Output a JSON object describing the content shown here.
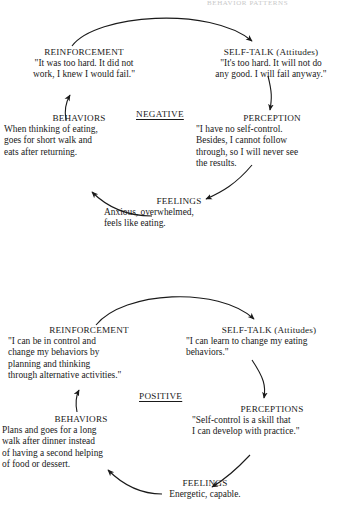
{
  "page": {
    "cropped_header": "BEHAVIOR PATTERNS"
  },
  "diagrams": [
    {
      "id": "negative-cycle",
      "center_label": "NEGATIVE",
      "nodes": [
        {
          "key": "reinforcement",
          "title": "REINFORCEMENT",
          "body": "\"It was too hard. It did not\nwork, I knew I would fail.\""
        },
        {
          "key": "self-talk",
          "title": "SELF-TALK (Attitudes)",
          "body": "\"It's too hard. It will not do\nany good. I will fail anyway.\""
        },
        {
          "key": "perception",
          "title": "PERCEPTION",
          "body": "\"I have no self-control.\nBesides, I cannot follow\nthrough, so I will never see\nthe results."
        },
        {
          "key": "feelings",
          "title": "FEELINGS",
          "body": "Anxious, overwhelmed,\nfeels like eating."
        },
        {
          "key": "behaviors",
          "title": "BEHAVIORS",
          "body": "When thinking of eating,\ngoes for short walk and\neats after returning."
        }
      ]
    },
    {
      "id": "positive-cycle",
      "center_label": "POSITIVE",
      "nodes": [
        {
          "key": "reinforcement",
          "title": "REINFORCEMENT",
          "body": "\"I can be in control and\nchange my behaviors by\nplanning and thinking\nthrough alternative activities.\""
        },
        {
          "key": "self-talk",
          "title": "SELF-TALK (Attitudes)",
          "body": "\"I can learn to change my eating\nbehaviors.\""
        },
        {
          "key": "perceptions",
          "title": "PERCEPTIONS",
          "body": "\"Self-control is a skill that\nI can develop with practice.\""
        },
        {
          "key": "feelings",
          "title": "FEELINGS",
          "body": "Energetic, capable."
        },
        {
          "key": "behaviors",
          "title": "BEHAVIORS",
          "body": "Plans and goes for a long\nwalk after dinner instead\nof having a second helping\nof food or dessert."
        }
      ]
    }
  ],
  "colors": {
    "ink": "#1a1a1a",
    "background": "#ffffff"
  }
}
